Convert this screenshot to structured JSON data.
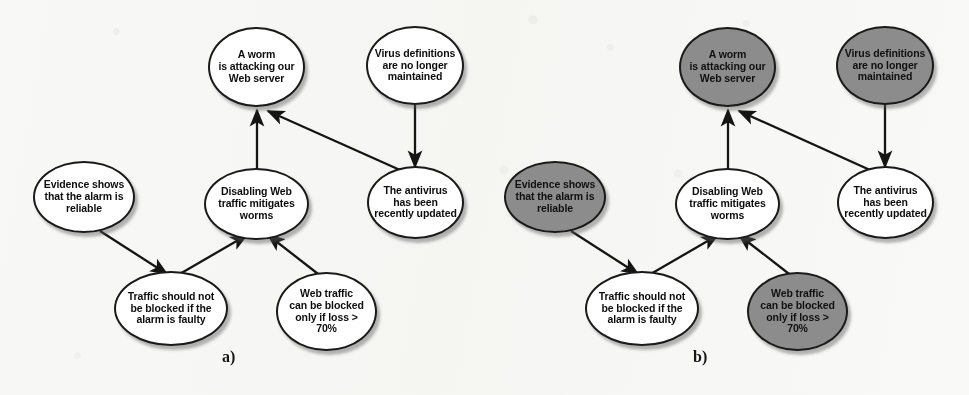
{
  "figure": {
    "type": "argumentation-graph-pair",
    "background_color": "#fbfbfa",
    "node_fill_white": "#ffffff",
    "node_fill_shaded": "#8c8c8c",
    "stroke_color": "#1a1a1a"
  },
  "nodes": {
    "worm": {
      "label": "A worm\nis attacking our\nWeb server"
    },
    "virus_defs": {
      "label": "Virus definitions\nare no longer\nmaintained"
    },
    "evidence": {
      "label": "Evidence shows\nthat the alarm is\nreliable"
    },
    "disabling": {
      "label": "Disabling Web\ntraffic mitigates\nworms"
    },
    "antivirus": {
      "label": "The antivirus\nhas been\nrecently updated"
    },
    "traffic_block": {
      "label": "Traffic should not\nbe blocked if the\nalarm is faulty"
    },
    "web_traffic": {
      "label": "Web traffic\ncan be blocked\nonly if loss >\n70%"
    }
  },
  "panels": [
    {
      "id": "a",
      "caption": "a)",
      "shaded_nodes": []
    },
    {
      "id": "b",
      "caption": "b)",
      "shaded_nodes": [
        "worm",
        "virus_defs",
        "evidence",
        "web_traffic"
      ]
    }
  ],
  "edges": [
    {
      "from": "disabling",
      "to": "worm",
      "style": "arrow"
    },
    {
      "from": "antivirus",
      "to": "worm",
      "style": "arrow"
    },
    {
      "from": "virus_defs",
      "to": "antivirus",
      "style": "arrow"
    },
    {
      "from": "evidence",
      "to": "traffic_block",
      "style": "arrow"
    },
    {
      "from": "traffic_block",
      "to": "disabling",
      "style": "arrow"
    },
    {
      "from": "web_traffic",
      "to": "disabling",
      "style": "arrow"
    }
  ]
}
